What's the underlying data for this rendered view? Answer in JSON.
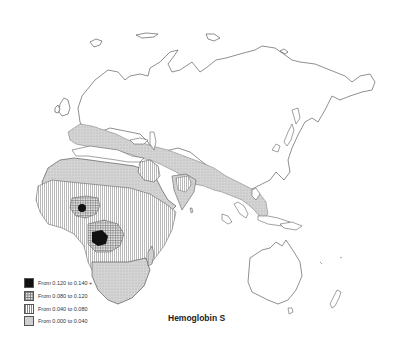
{
  "map": {
    "title": "Hemoglobin S",
    "region": "Africa, Europe, Asia and Oceania",
    "legend": [
      {
        "label": "From 0.120 to 0.140 +",
        "pattern": "solid-black",
        "color": "#111111"
      },
      {
        "label": "From 0.080 to 0.120",
        "pattern": "crosshatch",
        "color": "#8a8a8a"
      },
      {
        "label": "From 0.040 to 0.080",
        "pattern": "vertical-lines",
        "color": "#9a9a9a"
      },
      {
        "label": "From 0.000 to 0.040",
        "pattern": "light-stipple",
        "color": "#c8c8c8"
      }
    ],
    "regions": [
      {
        "name": "Mediterranean / Europe south",
        "class": "From 0.000 to 0.040"
      },
      {
        "name": "Sahara / North Africa",
        "class": "From 0.000 to 0.040"
      },
      {
        "name": "Middle East / Central Asia to SE Asia band",
        "class": "From 0.000 to 0.040"
      },
      {
        "name": "Sub-Saharan Africa belt",
        "class": "From 0.040 to 0.080"
      },
      {
        "name": "Arabian Peninsula pocket",
        "class": "From 0.040 to 0.080"
      },
      {
        "name": "India (central)",
        "class": "From 0.040 to 0.080"
      },
      {
        "name": "West Africa (Nigeria region)",
        "class": "From 0.080 to 0.120"
      },
      {
        "name": "Central Africa (Congo basin)",
        "class": "From 0.080 to 0.120"
      },
      {
        "name": "Nigeria hotspot",
        "class": "From 0.120 to 0.140 +"
      },
      {
        "name": "Gabon / Congo coast hotspot",
        "class": "From 0.120 to 0.140 +"
      }
    ]
  }
}
